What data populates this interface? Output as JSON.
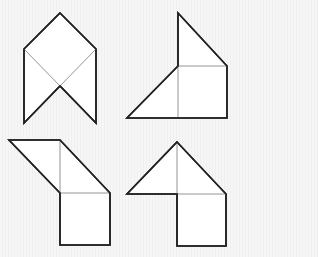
{
  "figure": {
    "colors": {
      "background": "#f3f3f3",
      "fill": "#ffffff",
      "outline": "#222222",
      "inner_line": "#888888"
    },
    "shapes": [
      {
        "id": "top-left",
        "outline": "60,13 96,49 96,123 60,86 24,123 24,49",
        "inner_lines": [
          [
            24,
            49,
            60,
            86
          ],
          [
            96,
            49,
            60,
            86
          ]
        ]
      },
      {
        "id": "top-right",
        "outline": "178,13 227,66 227,118 127,118 178,66",
        "inner_lines": [
          [
            178,
            66,
            227,
            66
          ],
          [
            178,
            66,
            178,
            118
          ]
        ]
      },
      {
        "id": "bottom-left",
        "outline": "9,140 60,140 110,193 110,245 60,245 60,193",
        "inner_lines": [
          [
            60,
            140,
            60,
            193
          ],
          [
            60,
            193,
            110,
            193
          ]
        ]
      },
      {
        "id": "bottom-right",
        "outline": "177,142 226,194 226,246 177,246 177,194 127,194",
        "inner_lines": [
          [
            177,
            142,
            177,
            194
          ],
          [
            177,
            194,
            226,
            194
          ]
        ]
      }
    ]
  }
}
